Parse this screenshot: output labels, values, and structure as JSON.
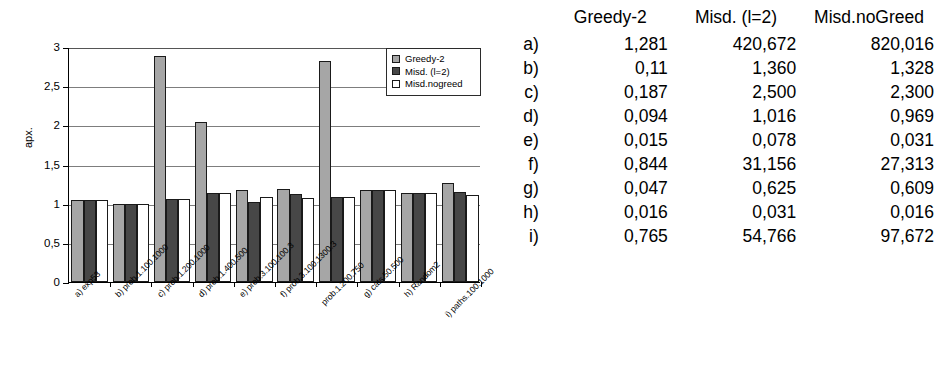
{
  "chart_data": {
    "type": "bar",
    "title": "",
    "xlabel": "",
    "ylabel": "apx.",
    "ylim": [
      0,
      3
    ],
    "ytick_labels": [
      "0",
      "0,5",
      "1",
      "1,5",
      "2",
      "2,5",
      "3"
    ],
    "ytick_values": [
      0,
      0.5,
      1,
      1.5,
      2,
      2.5,
      3
    ],
    "grid": true,
    "legend_position": "top-right",
    "categories": [
      "a) exp53",
      "b) prob.1.100.1000",
      "c) prob.1.200.1000",
      "d) prob.1.400.500",
      "e) prob.3.100.100.3",
      "f) prob.3.100.1300.3",
      "prob.1.200.750",
      "g) cats.50.500",
      "h) Random2",
      "i) paths.100.1000"
    ],
    "series": [
      {
        "name": "Greedy-2",
        "color": "#a6a6a6",
        "values": [
          1.05,
          1.0,
          2.88,
          2.04,
          1.18,
          1.19,
          2.82,
          1.17,
          1.13,
          1.26
        ]
      },
      {
        "name": "Misd. (l=2)",
        "color": "#474747",
        "values": [
          1.05,
          1.0,
          1.06,
          1.13,
          1.02,
          1.12,
          1.08,
          1.17,
          1.13,
          1.15
        ]
      },
      {
        "name": "Misd.nogreed",
        "color": "#ffffff",
        "values": [
          1.05,
          1.0,
          1.06,
          1.13,
          1.09,
          1.07,
          1.08,
          1.17,
          1.14,
          1.11
        ]
      }
    ]
  },
  "table": {
    "row_header_label": "",
    "columns": [
      "Greedy-2",
      "Misd. (l=2)",
      "Misd.noGreed"
    ],
    "rows": [
      {
        "label": "a)",
        "values": [
          "1,281",
          "420,672",
          "820,016"
        ]
      },
      {
        "label": "b)",
        "values": [
          "0,11",
          "1,360",
          "1,328"
        ]
      },
      {
        "label": "c)",
        "values": [
          "0,187",
          "2,500",
          "2,300"
        ]
      },
      {
        "label": "d)",
        "values": [
          "0,094",
          "1,016",
          "0,969"
        ]
      },
      {
        "label": "e)",
        "values": [
          "0,015",
          "0,078",
          "0,031"
        ]
      },
      {
        "label": "f)",
        "values": [
          "0,844",
          "31,156",
          "27,313"
        ]
      },
      {
        "label": "g)",
        "values": [
          "0,047",
          "0,625",
          "0,609"
        ]
      },
      {
        "label": "h)",
        "values": [
          "0,016",
          "0,031",
          "0,016"
        ]
      },
      {
        "label": "i)",
        "values": [
          "0,765",
          "54,766",
          "97,672"
        ]
      }
    ]
  }
}
